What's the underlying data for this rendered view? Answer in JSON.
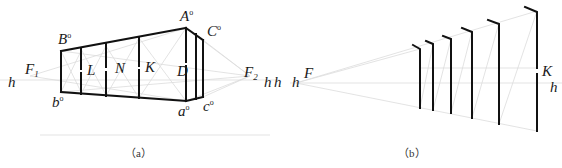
{
  "figure": {
    "panel_a": {
      "caption": "（a）",
      "labels": {
        "A": "A",
        "A_sup": "o",
        "B": "B",
        "B_sup": "o",
        "C": "C",
        "C_sup": "o",
        "a": "a",
        "a_sup": "o",
        "b": "b",
        "b_sup": "o",
        "c": "c",
        "c_sup": "o",
        "F1": "F",
        "F1_sub": "1",
        "F2": "F",
        "F2_sub": "2",
        "h_left": "h",
        "h_right": "h",
        "L": "L",
        "N": "N",
        "K": "K",
        "D": "D"
      }
    },
    "panel_b": {
      "caption": "（b）",
      "labels": {
        "F": "F",
        "h_left": "h",
        "h_mid": "h",
        "K": "K",
        "h_right": "h"
      },
      "post_count": 6
    },
    "colors": {
      "line": "#111111",
      "construction": "#d8d8d8",
      "text": "#1a1a1a"
    }
  }
}
